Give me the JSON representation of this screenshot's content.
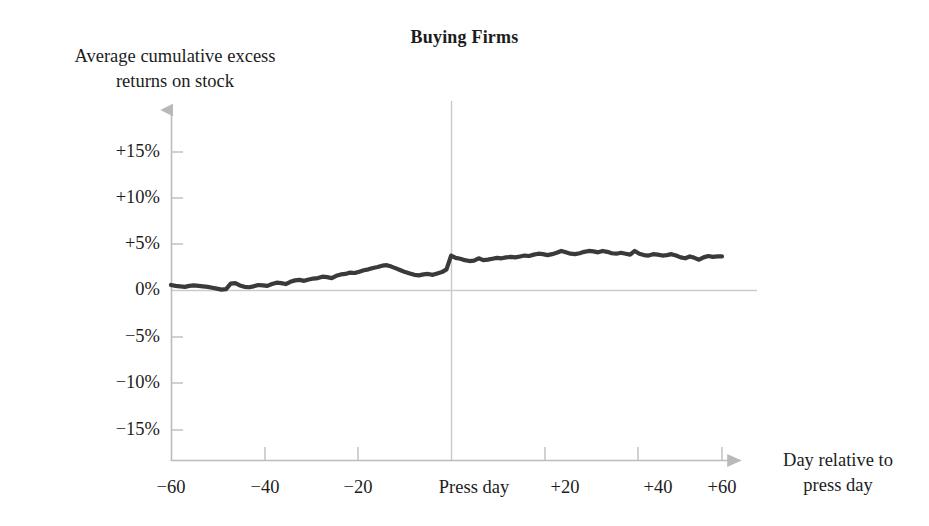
{
  "chart_data": {
    "type": "line",
    "title": "Buying Firms",
    "xlabel": "Day relative to press day",
    "xlabel_lines": [
      "Day relative to",
      "press day"
    ],
    "ylabel": "Average cumulative excess returns on stock",
    "ylabel_lines": [
      "Average cumulative excess",
      "returns on stock"
    ],
    "xlim": [
      -62,
      62
    ],
    "ylim": [
      -17,
      17
    ],
    "grid": false,
    "legend": null,
    "series_name": "Average cumulative excess returns on stock",
    "yticks": [
      15,
      10,
      5,
      0,
      -5,
      -10,
      -15
    ],
    "ytick_labels": [
      "+15%",
      "+10%",
      "+5%",
      "0%",
      "−5%",
      "−10%",
      "−15%"
    ],
    "xticks": [
      -60,
      -40,
      -20,
      0,
      20,
      40,
      60
    ],
    "xtick_labels": [
      "−60",
      "−40",
      "−20",
      "Press day",
      "+20",
      "+40",
      "+60"
    ],
    "annotations": [
      {
        "name": "press-day-marker",
        "x": 0,
        "label": "Press day"
      },
      {
        "name": "zero-return-baseline",
        "y": 0
      }
    ],
    "colors": {
      "line": "#3a3a3a",
      "axis": "#b9b9b9",
      "reference_line": "#c9c9c9",
      "text": "#1c1c1c",
      "background": "#ffffff"
    },
    "x": [
      -60,
      -59,
      -58,
      -57,
      -56,
      -55,
      -54,
      -53,
      -52,
      -51,
      -50,
      -49,
      -48,
      -47,
      -46,
      -45,
      -44,
      -43,
      -42,
      -41,
      -40,
      -39,
      -38,
      -37,
      -36,
      -35,
      -34,
      -33,
      -32,
      -31,
      -30,
      -29,
      -28,
      -27,
      -26,
      -25,
      -24,
      -23,
      -22,
      -21,
      -20,
      -19,
      -18,
      -17,
      -16,
      -15,
      -14,
      -13,
      -12,
      -11,
      -10,
      -9,
      -8,
      -7,
      -6,
      -5,
      -4,
      -3,
      -2,
      -1,
      0,
      1,
      2,
      3,
      4,
      5,
      6,
      7,
      8,
      9,
      10,
      11,
      12,
      13,
      14,
      15,
      16,
      17,
      18,
      19,
      20,
      21,
      22,
      23,
      24,
      25,
      26,
      27,
      28,
      29,
      30,
      31,
      32,
      33,
      34,
      35,
      36,
      37,
      38,
      39,
      40,
      41,
      42,
      43,
      44,
      45,
      46,
      47,
      48,
      49,
      50,
      51,
      52,
      53,
      54,
      55,
      56,
      57,
      58,
      59,
      60
    ],
    "values": [
      0.6,
      0.5,
      0.45,
      0.4,
      0.5,
      0.55,
      0.5,
      0.45,
      0.4,
      0.3,
      0.2,
      0.1,
      0.15,
      0.75,
      0.8,
      0.55,
      0.4,
      0.35,
      0.45,
      0.6,
      0.55,
      0.5,
      0.7,
      0.85,
      0.8,
      0.7,
      0.95,
      1.1,
      1.15,
      1.05,
      1.2,
      1.3,
      1.35,
      1.5,
      1.45,
      1.35,
      1.6,
      1.75,
      1.8,
      1.95,
      1.9,
      2.05,
      2.2,
      2.3,
      2.45,
      2.55,
      2.7,
      2.75,
      2.6,
      2.4,
      2.2,
      2.0,
      1.85,
      1.7,
      1.65,
      1.75,
      1.8,
      1.7,
      1.85,
      2.0,
      2.3,
      3.8,
      3.55,
      3.45,
      3.3,
      3.2,
      3.25,
      3.5,
      3.3,
      3.35,
      3.45,
      3.55,
      3.5,
      3.6,
      3.65,
      3.6,
      3.7,
      3.8,
      3.75,
      3.9,
      4.0,
      3.95,
      3.85,
      3.95,
      4.1,
      4.3,
      4.15,
      4.0,
      3.95,
      4.05,
      4.2,
      4.3,
      4.25,
      4.15,
      4.3,
      4.2,
      4.05,
      4.0,
      4.1,
      4.0,
      3.9,
      4.3,
      4.0,
      3.85,
      3.8,
      3.95,
      3.9,
      3.8,
      3.85,
      3.95,
      3.8,
      3.6,
      3.5,
      3.7,
      3.55,
      3.35,
      3.6,
      3.75,
      3.65,
      3.7,
      3.7
    ]
  }
}
